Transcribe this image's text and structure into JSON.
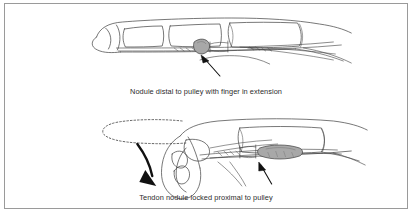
{
  "figure": {
    "border_color": "#9a9a9a",
    "ink_color": "#3c3c3c",
    "nodule_fill": "#a8a8a8",
    "arrow_color": "#111111",
    "background": "#ffffff"
  },
  "panels": [
    {
      "id": "extension",
      "caption": "Nodule distal to pulley with finger in extension",
      "finger_state": "extended",
      "nodule_position": "distal to pulley",
      "annotations": [
        "pointer-arrow-to-nodule"
      ]
    },
    {
      "id": "flexion",
      "caption": "Tendon nodule locked proximal to pulley",
      "finger_state": "flexed",
      "nodule_position": "proximal to pulley",
      "annotations": [
        "pointer-arrow-to-nodule",
        "curved-motion-arrow",
        "dotted-ghost-outline"
      ]
    }
  ]
}
